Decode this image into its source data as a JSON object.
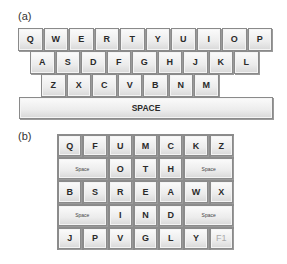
{
  "panel_a": {
    "label": "(a)",
    "rows": [
      [
        "Q",
        "W",
        "E",
        "R",
        "T",
        "Y",
        "U",
        "I",
        "O",
        "P"
      ],
      [
        "A",
        "S",
        "D",
        "F",
        "G",
        "H",
        "J",
        "K",
        "L"
      ],
      [
        "Z",
        "X",
        "C",
        "V",
        "B",
        "N",
        "M"
      ]
    ],
    "space_label": "SPACE"
  },
  "panel_b": {
    "label": "(b)",
    "rows": [
      [
        {
          "k": "Q"
        },
        {
          "k": "F"
        },
        {
          "k": "U"
        },
        {
          "k": "M"
        },
        {
          "k": "C"
        },
        {
          "k": "K"
        },
        {
          "k": "Z"
        }
      ],
      [
        {
          "k": "Space",
          "span": 2
        },
        {
          "k": "O"
        },
        {
          "k": "T"
        },
        {
          "k": "H"
        },
        {
          "k": "Space",
          "span": 2
        }
      ],
      [
        {
          "k": "B"
        },
        {
          "k": "S"
        },
        {
          "k": "R"
        },
        {
          "k": "E"
        },
        {
          "k": "A"
        },
        {
          "k": "W"
        },
        {
          "k": "X"
        }
      ],
      [
        {
          "k": "Space",
          "span": 2
        },
        {
          "k": "I"
        },
        {
          "k": "N"
        },
        {
          "k": "D"
        },
        {
          "k": "Space",
          "span": 2
        }
      ],
      [
        {
          "k": "J"
        },
        {
          "k": "P"
        },
        {
          "k": "V"
        },
        {
          "k": "G"
        },
        {
          "k": "L"
        },
        {
          "k": "Y"
        },
        {
          "k": "F1",
          "dim": true
        }
      ]
    ]
  }
}
